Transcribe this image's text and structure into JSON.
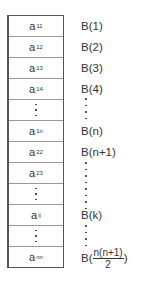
{
  "table": {
    "rows": [
      {
        "base": "a",
        "sub": "11",
        "type": "cell"
      },
      {
        "base": "a",
        "sub": "12",
        "type": "cell"
      },
      {
        "base": "a",
        "sub": "13",
        "type": "cell"
      },
      {
        "base": "a",
        "sub": "14",
        "type": "cell"
      },
      {
        "type": "dots"
      },
      {
        "base": "a",
        "sub": "1n",
        "type": "cell"
      },
      {
        "base": "a",
        "sub": "22",
        "type": "cell"
      },
      {
        "base": "a",
        "sub": "23",
        "type": "cell"
      },
      {
        "type": "dots"
      },
      {
        "base": "a",
        "sub": "ij",
        "type": "cell"
      },
      {
        "type": "dots"
      },
      {
        "base": "a",
        "sub": "nn",
        "type": "cell"
      }
    ]
  },
  "labels": {
    "b1": "B(1)",
    "b2": "B(2)",
    "b3": "B(3)",
    "b4": "B(4)",
    "bn": "B(n)",
    "bn1": "B(n+1)",
    "bk": "B(k)",
    "blast_prefix": "B(",
    "blast_num": "n(n+1)",
    "blast_den": "2",
    "blast_suffix": ")"
  }
}
